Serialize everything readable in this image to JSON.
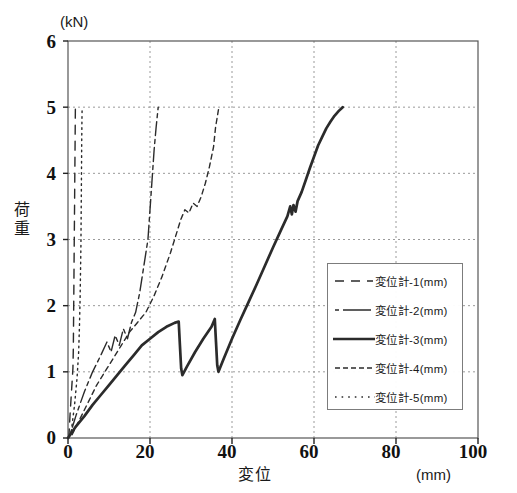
{
  "chart": {
    "title": "",
    "y_unit_label": "(kN)",
    "x_unit_label": "(mm)",
    "xlabel": "変位",
    "ylabel": "荷重",
    "ylabel_chars": [
      "荷",
      "重"
    ],
    "xticks": [
      "0",
      "20",
      "40",
      "60",
      "80",
      "100"
    ],
    "yticks": [
      "0",
      "1",
      "2",
      "3",
      "4",
      "5",
      "6"
    ],
    "axis_color": "#555555",
    "grid_color": "#9a9a9a",
    "series_color": "#2b2b2b"
  },
  "legend": {
    "items": [
      {
        "label": "変位計-1(mm)",
        "style": "long-dash"
      },
      {
        "label": "変位計-2(mm)",
        "style": "dash-dot-long"
      },
      {
        "label": "変位計-3(mm)",
        "style": "solid-thick"
      },
      {
        "label": "変位計-4(mm)",
        "style": "medium-dash"
      },
      {
        "label": "変位計-5(mm)",
        "style": "dotted"
      }
    ]
  },
  "chart_data": {
    "type": "line",
    "title": "",
    "xlabel": "変位",
    "ylabel": "荷重",
    "x_unit": "(mm)",
    "y_unit": "(kN)",
    "xlim": [
      0,
      100
    ],
    "ylim": [
      0,
      6
    ],
    "xticks": [
      0,
      20,
      40,
      60,
      80,
      100
    ],
    "yticks": [
      0,
      1,
      2,
      3,
      4,
      5,
      6
    ],
    "grid": true,
    "legend_position": "center-right",
    "series": [
      {
        "name": "変位計-1(mm)",
        "style": "long-dash",
        "points": [
          [
            0.2,
            0.0
          ],
          [
            0.5,
            0.35
          ],
          [
            0.9,
            0.75
          ],
          [
            1.2,
            1.05
          ],
          [
            1.3,
            1.35
          ],
          [
            1.35,
            1.7
          ],
          [
            1.4,
            2.05
          ],
          [
            1.45,
            2.4
          ],
          [
            1.5,
            2.8
          ],
          [
            1.55,
            3.15
          ],
          [
            1.6,
            3.5
          ],
          [
            1.65,
            3.9
          ],
          [
            1.7,
            4.25
          ],
          [
            1.75,
            4.6
          ],
          [
            1.8,
            5.0
          ]
        ]
      },
      {
        "name": "変位計-2(mm)",
        "style": "dash-dot-long",
        "points": [
          [
            0.5,
            0.05
          ],
          [
            2.0,
            0.35
          ],
          [
            4.0,
            0.7
          ],
          [
            6.0,
            1.0
          ],
          [
            8.0,
            1.25
          ],
          [
            9.5,
            1.45
          ],
          [
            10.5,
            1.3
          ],
          [
            11.5,
            1.55
          ],
          [
            12.5,
            1.4
          ],
          [
            13.5,
            1.65
          ],
          [
            14.5,
            1.5
          ],
          [
            15.5,
            1.75
          ],
          [
            16.5,
            1.9
          ],
          [
            17.5,
            2.2
          ],
          [
            18.5,
            2.6
          ],
          [
            19.5,
            3.0
          ],
          [
            20.0,
            3.45
          ],
          [
            20.5,
            3.9
          ],
          [
            21.0,
            4.35
          ],
          [
            21.5,
            4.7
          ],
          [
            22.0,
            5.0
          ]
        ]
      },
      {
        "name": "変位計-3(mm)",
        "style": "solid-thick",
        "points": [
          [
            0.0,
            0.0
          ],
          [
            2.0,
            0.18
          ],
          [
            4.0,
            0.33
          ],
          [
            6.0,
            0.5
          ],
          [
            8.0,
            0.65
          ],
          [
            10.0,
            0.8
          ],
          [
            12.0,
            0.95
          ],
          [
            14.0,
            1.1
          ],
          [
            16.0,
            1.25
          ],
          [
            18.0,
            1.4
          ],
          [
            20.0,
            1.5
          ],
          [
            22.0,
            1.6
          ],
          [
            24.0,
            1.68
          ],
          [
            26.0,
            1.74
          ],
          [
            27.0,
            1.76
          ],
          [
            27.3,
            1.4
          ],
          [
            27.6,
            1.05
          ],
          [
            27.9,
            0.95
          ],
          [
            29.0,
            1.08
          ],
          [
            31.0,
            1.3
          ],
          [
            33.0,
            1.5
          ],
          [
            35.0,
            1.68
          ],
          [
            35.8,
            1.8
          ],
          [
            36.1,
            1.45
          ],
          [
            36.4,
            1.1
          ],
          [
            36.7,
            1.0
          ],
          [
            38.0,
            1.2
          ],
          [
            40.0,
            1.5
          ],
          [
            42.0,
            1.78
          ],
          [
            44.0,
            2.05
          ],
          [
            46.0,
            2.32
          ],
          [
            48.0,
            2.6
          ],
          [
            50.0,
            2.88
          ],
          [
            52.0,
            3.15
          ],
          [
            53.5,
            3.35
          ],
          [
            54.2,
            3.5
          ],
          [
            54.6,
            3.38
          ],
          [
            55.0,
            3.52
          ],
          [
            55.5,
            3.42
          ],
          [
            56.0,
            3.58
          ],
          [
            57.0,
            3.72
          ],
          [
            58.0,
            3.9
          ],
          [
            59.0,
            4.08
          ],
          [
            60.0,
            4.25
          ],
          [
            61.0,
            4.42
          ],
          [
            62.0,
            4.55
          ],
          [
            63.0,
            4.68
          ],
          [
            64.0,
            4.78
          ],
          [
            65.0,
            4.87
          ],
          [
            66.0,
            4.94
          ],
          [
            67.0,
            5.0
          ]
        ]
      },
      {
        "name": "変位計-4(mm)",
        "style": "medium-dash",
        "points": [
          [
            1.0,
            0.05
          ],
          [
            3.0,
            0.3
          ],
          [
            5.0,
            0.55
          ],
          [
            7.0,
            0.8
          ],
          [
            9.0,
            1.0
          ],
          [
            11.0,
            1.2
          ],
          [
            13.0,
            1.4
          ],
          [
            15.0,
            1.6
          ],
          [
            17.0,
            1.75
          ],
          [
            19.0,
            1.9
          ],
          [
            21.0,
            2.15
          ],
          [
            23.0,
            2.45
          ],
          [
            25.0,
            2.8
          ],
          [
            26.5,
            3.1
          ],
          [
            27.5,
            3.3
          ],
          [
            28.5,
            3.45
          ],
          [
            29.5,
            3.4
          ],
          [
            30.5,
            3.55
          ],
          [
            31.5,
            3.5
          ],
          [
            32.5,
            3.65
          ],
          [
            33.5,
            3.85
          ],
          [
            34.5,
            4.1
          ],
          [
            35.5,
            4.4
          ],
          [
            36.0,
            4.7
          ],
          [
            36.8,
            5.0
          ]
        ]
      },
      {
        "name": "変位計-5(mm)",
        "style": "dotted",
        "points": [
          [
            0.8,
            0.1
          ],
          [
            1.6,
            0.5
          ],
          [
            2.2,
            0.9
          ],
          [
            2.6,
            1.3
          ],
          [
            2.8,
            1.7
          ],
          [
            2.95,
            2.1
          ],
          [
            3.05,
            2.5
          ],
          [
            3.15,
            2.9
          ],
          [
            3.2,
            3.3
          ],
          [
            3.25,
            3.7
          ],
          [
            3.3,
            4.1
          ],
          [
            3.35,
            4.5
          ],
          [
            3.4,
            4.8
          ],
          [
            3.45,
            5.0
          ]
        ]
      }
    ]
  }
}
